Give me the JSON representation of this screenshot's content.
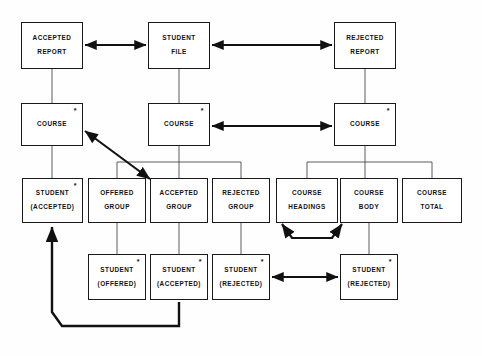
{
  "diagram": {
    "type": "data-structure-hierarchy-diagram",
    "nodes": [
      {
        "id": "accepted-report",
        "line1": "ACCEPTED",
        "line2": "REPORT",
        "star": false,
        "x": 21,
        "y": 22,
        "w": 62,
        "h": 47
      },
      {
        "id": "student-file",
        "line1": "STUDENT",
        "line2": "FILE",
        "star": false,
        "x": 148,
        "y": 22,
        "w": 62,
        "h": 47
      },
      {
        "id": "rejected-report",
        "line1": "REJECTED",
        "line2": "REPORT",
        "star": false,
        "x": 334,
        "y": 22,
        "w": 62,
        "h": 47
      },
      {
        "id": "course-left",
        "line1": "COURSE",
        "line2": "",
        "star": true,
        "x": 21,
        "y": 103,
        "w": 62,
        "h": 43
      },
      {
        "id": "course-middle",
        "line1": "COURSE",
        "line2": "",
        "star": true,
        "x": 148,
        "y": 103,
        "w": 62,
        "h": 43
      },
      {
        "id": "course-right",
        "line1": "COURSE",
        "line2": "",
        "star": true,
        "x": 334,
        "y": 103,
        "w": 62,
        "h": 43
      },
      {
        "id": "student-accepted-left",
        "line1": "STUDENT",
        "line2": "(ACCEPTED)",
        "star": true,
        "x": 22,
        "y": 178,
        "w": 61,
        "h": 45
      },
      {
        "id": "offered-group",
        "line1": "OFFERED",
        "line2": "GROUP",
        "star": false,
        "x": 88,
        "y": 178,
        "w": 58,
        "h": 45
      },
      {
        "id": "accepted-group",
        "line1": "ACCEPTED",
        "line2": "GROUP",
        "star": false,
        "x": 150,
        "y": 178,
        "w": 58,
        "h": 45
      },
      {
        "id": "rejected-group",
        "line1": "REJECTED",
        "line2": "GROUP",
        "star": false,
        "x": 212,
        "y": 178,
        "w": 58,
        "h": 45
      },
      {
        "id": "course-headings",
        "line1": "COURSE",
        "line2": "HEADINGS",
        "star": false,
        "x": 276,
        "y": 178,
        "w": 62,
        "h": 45
      },
      {
        "id": "course-body",
        "line1": "COURSE",
        "line2": "BODY",
        "star": false,
        "x": 340,
        "y": 178,
        "w": 58,
        "h": 45
      },
      {
        "id": "course-total",
        "line1": "COURSE",
        "line2": "TOTAL",
        "star": false,
        "x": 402,
        "y": 178,
        "w": 60,
        "h": 45
      },
      {
        "id": "student-offered",
        "line1": "STUDENT",
        "line2": "(OFFERED)",
        "star": true,
        "x": 88,
        "y": 254,
        "w": 58,
        "h": 46
      },
      {
        "id": "student-accepted-bottom",
        "line1": "STUDENT",
        "line2": "(ACCEPTED)",
        "star": true,
        "x": 150,
        "y": 254,
        "w": 58,
        "h": 46
      },
      {
        "id": "student-rejected-middle",
        "line1": "STUDENT",
        "line2": "(REJECTED)",
        "star": true,
        "x": 212,
        "y": 254,
        "w": 58,
        "h": 46
      },
      {
        "id": "student-rejected-right",
        "line1": "STUDENT",
        "line2": "(REJECTED)",
        "star": true,
        "x": 340,
        "y": 254,
        "w": 58,
        "h": 46
      }
    ],
    "star_symbol": "*",
    "connectors": {
      "thin_lines": [
        {
          "name": "accepted-report-to-course-left",
          "d": "M 52 69 L 52 103"
        },
        {
          "name": "student-file-to-course-middle",
          "d": "M 179 69 L 179 103"
        },
        {
          "name": "rejected-report-to-course-right",
          "d": "M 365 69 L 365 103"
        },
        {
          "name": "course-left-to-student-accepted-left",
          "d": "M 52 146 L 52 178"
        },
        {
          "name": "course-middle-fanout-stem",
          "d": "M 179 146 L 179 162"
        },
        {
          "name": "course-middle-fanout-bar",
          "d": "M 117 162 L 241 162"
        },
        {
          "name": "fanout-drop-offered-group",
          "d": "M 117 162 L 117 178"
        },
        {
          "name": "fanout-drop-accepted-group",
          "d": "M 179 162 L 179 178"
        },
        {
          "name": "fanout-drop-rejected-group",
          "d": "M 241 162 L 241 178"
        },
        {
          "name": "course-right-fanout-stem",
          "d": "M 365 146 L 365 162"
        },
        {
          "name": "course-right-fanout-bar",
          "d": "M 307 162 L 432 162"
        },
        {
          "name": "fanout-drop-course-headings",
          "d": "M 307 162 L 307 178"
        },
        {
          "name": "fanout-drop-course-body",
          "d": "M 365 162 L 365 178"
        },
        {
          "name": "fanout-drop-course-total",
          "d": "M 432 162 L 432 178"
        },
        {
          "name": "offered-group-to-student-offered",
          "d": "M 117 223 L 117 254"
        },
        {
          "name": "accepted-group-to-student-accepted",
          "d": "M 179 223 L 179 254"
        },
        {
          "name": "rejected-group-to-student-rejected",
          "d": "M 241 223 L 241 254"
        },
        {
          "name": "course-body-to-student-rejected-right",
          "d": "M 369 223 L 369 254"
        }
      ],
      "arrows": [
        {
          "name": "student-file-to-accepted-report-arrow",
          "d": "M 146 45 L 85 45",
          "double": true,
          "width": 1.9
        },
        {
          "name": "student-file-to-rejected-report-arrow",
          "d": "M 212 45 L 332 45",
          "double": true,
          "width": 1.9
        },
        {
          "name": "course-middle-to-course-right-arrow",
          "d": "M 212 126 L 332 126",
          "double": true,
          "width": 1.9
        },
        {
          "name": "course-left-to-accepted-group-diagonal-arrow",
          "d": "M 85 131 L 150 179",
          "double": true,
          "width": 2.1
        },
        {
          "name": "student-rejected-middle-to-right-arrow",
          "d": "M 272 277 L 338 277",
          "double": true,
          "width": 1.9
        },
        {
          "name": "course-headings-to-course-body-curve",
          "d": "M 282 224 L 292 238 L 332 238 L 342 224",
          "double": true,
          "width": 2.2
        },
        {
          "name": "student-accepted-bottom-to-left-feedback-path",
          "d": "M 179 302 L 179 326 L 62 326 L 52 312 L 52 227",
          "double": false,
          "width": 2.4
        }
      ]
    }
  }
}
